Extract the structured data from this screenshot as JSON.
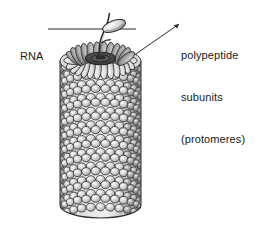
{
  "figure": {
    "name": "helical-virus-diagram",
    "background_color": "#ffffff",
    "width": 264,
    "height": 231
  },
  "labels": {
    "rna": {
      "text": "RNA",
      "icon": "leader-line-horizontal"
    },
    "subunits": {
      "line1": "polypeptide",
      "line2": "subunits",
      "line3": "(protomeres)",
      "icon": "leader-line-diagonal"
    }
  },
  "illustration": {
    "name": "helical-capsid-cylinder",
    "description": "Cylindrical helical virus capsid composed of many ellipsoidal protein subunits with a central RNA strand emerging from the top and one detached subunit.",
    "colors": {
      "outline": "#2b2b2b",
      "subunit_light": "#e8e8e8",
      "subunit_mid": "#c2c2c2",
      "subunit_shadow": "#8d8d8d",
      "core_dark": "#3a3a3a",
      "rna_strand": "#2b2b2b",
      "leader_line": "#2b2b2b"
    },
    "geometry": {
      "cylinder_left": 60,
      "cylinder_right": 141,
      "cylinder_top": 48,
      "cylinder_bottom": 218,
      "rim_ellipse_ry": 13,
      "rows": 22,
      "columns": 13,
      "detached_subunit": "capsomere-ellipse"
    }
  }
}
